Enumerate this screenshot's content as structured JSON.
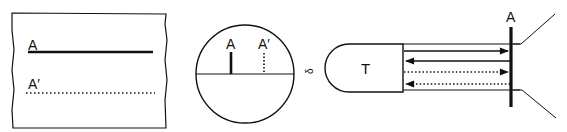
{
  "panel1": {
    "label_solid": "A",
    "label_dotted": "A′"
  },
  "panel2": {
    "label_solid": "A",
    "label_dotted": "A′"
  },
  "panel3": {
    "telescope_label": "T",
    "target_label": "A",
    "eyepiece_glyph": "δ"
  },
  "colors": {
    "ink": "#111111",
    "background": "#ffffff"
  }
}
